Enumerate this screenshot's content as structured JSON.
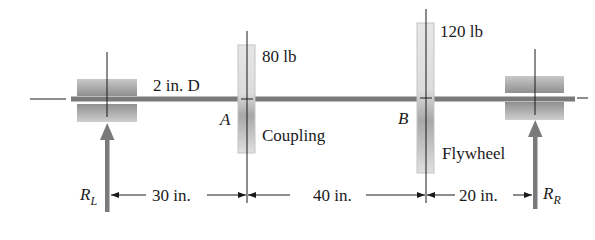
{
  "diagram": {
    "shaft": {
      "label": "2 in. D",
      "color": "#7a7a7a"
    },
    "coupling": {
      "point_label": "A",
      "weight_label": "80 lb",
      "name_label": "Coupling"
    },
    "flywheel": {
      "point_label": "B",
      "weight_label": "120 lb",
      "name_label": "Flywheel"
    },
    "left_reaction": {
      "symbol": "R",
      "subscript": "L"
    },
    "right_reaction": {
      "symbol": "R",
      "subscript": "R"
    },
    "dimensions": [
      {
        "label": "30 in."
      },
      {
        "label": "40 in."
      },
      {
        "label": "20 in."
      }
    ],
    "colors": {
      "shaft": "#7a7a7a",
      "bearing": "#9a9a9a",
      "disk_fill": "#e0e0e0",
      "line": "#1a1a1a",
      "arrow": "#7a7a7a"
    }
  }
}
